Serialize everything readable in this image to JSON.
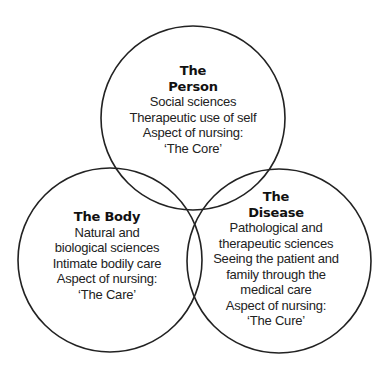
{
  "diagram": {
    "type": "venn",
    "circles": [
      {
        "id": "person",
        "title_lines": [
          "The",
          "Person"
        ],
        "lines": [
          "Social sciences",
          "Therapeutic use of self",
          "Aspect of nursing:",
          "‘The Core’"
        ]
      },
      {
        "id": "body",
        "title_lines": [
          "The Body"
        ],
        "lines": [
          "Natural and",
          "biological sciences",
          "Intimate bodily care",
          "Aspect of nursing:",
          "‘The Care’"
        ]
      },
      {
        "id": "disease",
        "title_lines": [
          "The",
          "Disease"
        ],
        "lines": [
          "Pathological and",
          "therapeutic sciences",
          "Seeing the patient and",
          "family through the",
          "medical care",
          "Aspect of nursing:",
          "‘The Cure’"
        ]
      }
    ],
    "stroke_color": "#222222",
    "background": "#ffffff"
  }
}
